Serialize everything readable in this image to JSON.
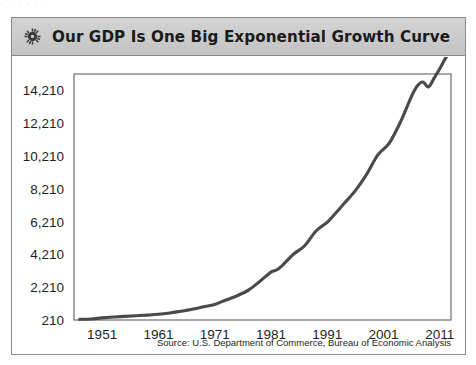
{
  "scan_artifact": {
    "text": "·   ·          ·        · ·            ·"
  },
  "figure": {
    "icon": "gear-icon",
    "title": "Our GDP Is One Big Exponential Growth Curve",
    "source": "Source: U.S. Department of Commerce, Bureau of Economic Analysis"
  },
  "chart_data": {
    "type": "line",
    "title": "Our GDP Is One Big Exponential Growth Curve",
    "xlabel": "",
    "ylabel": "",
    "xlim": [
      1946,
      2013
    ],
    "ylim": [
      210,
      15210
    ],
    "grid": true,
    "legend": null,
    "accent_color": "#4a4a4a",
    "x_tick_labels": [
      "1951",
      "1961",
      "1971",
      "1981",
      "1991",
      "2001",
      "2011"
    ],
    "x_tick_values": [
      1951,
      1961,
      1971,
      1981,
      1991,
      2001,
      2011
    ],
    "y_tick_labels": [
      "210",
      "2,210",
      "4,210",
      "6,210",
      "8,210",
      "10,210",
      "12,210",
      "14,210"
    ],
    "y_tick_values": [
      210,
      2210,
      4210,
      6210,
      8210,
      10210,
      12210,
      14210
    ],
    "series": [
      {
        "name": "U.S. GDP (billions of dollars)",
        "x": [
          1947,
          1949,
          1951,
          1953,
          1955,
          1957,
          1959,
          1961,
          1963,
          1965,
          1967,
          1969,
          1971,
          1973,
          1975,
          1977,
          1979,
          1981,
          1982,
          1983,
          1985,
          1987,
          1989,
          1991,
          1992,
          1994,
          1996,
          1998,
          2000,
          2002,
          2004,
          2006,
          2007,
          2008,
          2009,
          2010,
          2011,
          2012,
          2013
        ],
        "values": [
          250,
          270,
          340,
          390,
          430,
          470,
          510,
          560,
          640,
          740,
          860,
          1020,
          1160,
          1430,
          1690,
          2030,
          2560,
          3130,
          3260,
          3530,
          4220,
          4740,
          5640,
          6170,
          6540,
          7310,
          8100,
          9090,
          10280,
          10980,
          12270,
          13860,
          14480,
          14720,
          14420,
          14960,
          15530,
          16160,
          16660
        ]
      }
    ],
    "annotations": [
      {
        "label": "1982 recession plateau",
        "x": 1982
      },
      {
        "label": "1991 recession plateau",
        "x": 1991
      },
      {
        "label": "2008-2009 downturn dip",
        "x": 2009
      }
    ]
  }
}
